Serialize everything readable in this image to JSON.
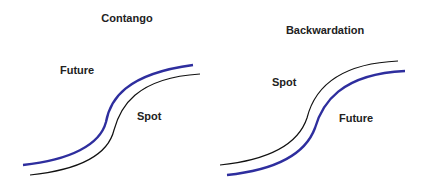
{
  "panels": [
    {
      "title": "Contango",
      "labels": {
        "upper": "Future",
        "lower": "Spot"
      },
      "upper_curve": "Future",
      "lower_curve": "Spot"
    },
    {
      "title": "Backwardation",
      "labels": {
        "upper": "Spot",
        "lower": "Future"
      },
      "upper_curve": "Spot",
      "lower_curve": "Future"
    }
  ],
  "colors": {
    "future": "#2e2e9e",
    "spot": "#111111"
  }
}
